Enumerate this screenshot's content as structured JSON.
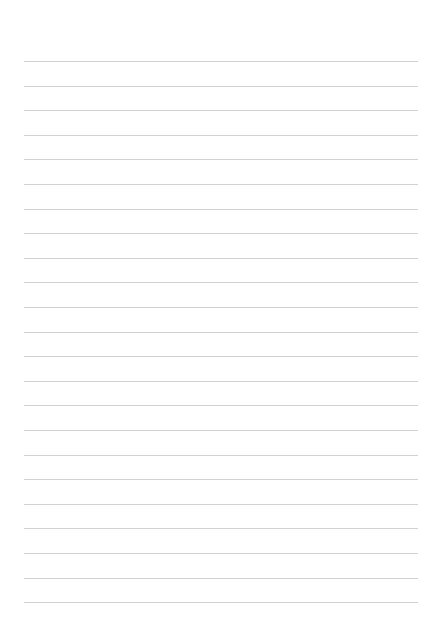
{
  "page": {
    "type": "lined-paper",
    "line_count": 23,
    "first_line_y": 61,
    "line_spacing": 24.6,
    "line_left": 24,
    "line_right": 418,
    "line_color": "#d2d2d2",
    "background_color": "#ffffff"
  }
}
